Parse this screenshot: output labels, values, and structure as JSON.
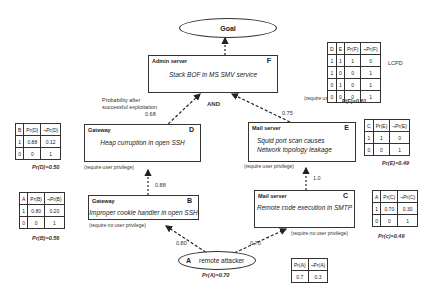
{
  "goal": {
    "label": "Goal"
  },
  "nodes": {
    "F": {
      "id": "F",
      "host": "Admin server",
      "vuln": "Stack BOF in MS SMV service",
      "privilege": "(require user privilege)"
    },
    "D": {
      "id": "D",
      "host": "Gateway",
      "vuln": "Heap curruption in open SSH",
      "privilege": "(require user privilege)"
    },
    "E": {
      "id": "E",
      "host": "Mail server",
      "vuln_line1": "Squid port scan causes",
      "vuln_line2": "Network topology leakage",
      "privilege": "(require user privilege)"
    },
    "B": {
      "id": "B",
      "host": "Gateway",
      "vuln": "Improper cookie handler in open SSH",
      "privilege": "(require no user privilege)"
    },
    "C": {
      "id": "C",
      "host": "Mail server",
      "vuln": "Remote code execution in SMTP",
      "privilege": "(require no user privilege)"
    },
    "A": {
      "id": "A",
      "label": "remote attacker",
      "prob": "Pr(A)=0.70"
    }
  },
  "edges": {
    "D_F": {
      "prob": "0.68",
      "caption_line1": "Probability after",
      "caption_line2": "successful exploitation"
    },
    "E_F": {
      "prob": "0.75"
    },
    "and_label": "AND",
    "B_D": {
      "prob": "0.88"
    },
    "C_E": {
      "prob": "1.0"
    },
    "A_B": {
      "prob": "0.80"
    },
    "A_C": {
      "prob": "0.70"
    }
  },
  "tables": {
    "F": {
      "headers": [
        "D",
        "E",
        "Pr(F)",
        "¬Pr(F)"
      ],
      "rows": [
        [
          "1",
          "1",
          "1",
          "0"
        ],
        [
          "1",
          "0",
          "0",
          "1"
        ],
        [
          "0",
          "1",
          "0",
          "1"
        ],
        [
          "0",
          "0",
          "0",
          "1"
        ]
      ],
      "side_label": "LCPD",
      "result": "P(F)=0.61"
    },
    "D": {
      "headers": [
        "B",
        "Pr(D)",
        "¬Pr(D)"
      ],
      "rows": [
        [
          "1",
          "0.88",
          "0.12"
        ],
        [
          "0",
          "0",
          "1"
        ]
      ],
      "result": "Pr(D)=0.50"
    },
    "E": {
      "headers": [
        "C",
        "Pr(E)",
        "¬Pr(E)"
      ],
      "rows": [
        [
          "1",
          "1",
          "0"
        ],
        [
          "0",
          "0",
          "1"
        ]
      ],
      "result": "Pr(E)=0.49"
    },
    "B": {
      "headers": [
        "A",
        "Pr(B)",
        "¬Pr(B)"
      ],
      "rows": [
        [
          "1",
          "0.80",
          "0.20"
        ],
        [
          "0",
          "0",
          "1"
        ]
      ],
      "result": "Pr(B)=0.56"
    },
    "C": {
      "headers": [
        "A",
        "Pr(C)",
        "¬Pr(C)"
      ],
      "rows": [
        [
          "1",
          "0.70",
          "0.30"
        ],
        [
          "0",
          "0",
          "1"
        ]
      ],
      "result": "Pr(c)=0.49"
    },
    "A": {
      "headers": [
        "Pr(A)",
        "¬Pr(A)"
      ],
      "rows": [
        [
          "0.7",
          "0.3"
        ]
      ]
    }
  }
}
